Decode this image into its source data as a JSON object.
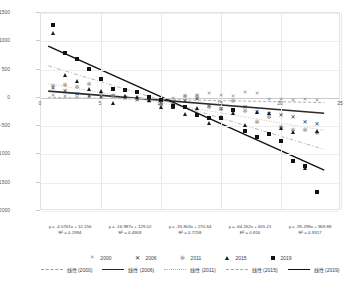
{
  "chart_data": {
    "type": "scatter",
    "title": "",
    "xlabel": "",
    "ylabel": "",
    "xlim": [
      0,
      25
    ],
    "ylim": [
      -2000,
      1500
    ],
    "grid": true,
    "legend_position": "bottom",
    "x_ticks": [
      "0",
      "5",
      "10",
      "15",
      "20",
      "25"
    ],
    "y_ticks": [
      "1500",
      "1000",
      "500",
      "0",
      "-500",
      "-1000",
      "-1500",
      "-2000"
    ],
    "series": [
      {
        "name": "2000",
        "marker": "x-thin",
        "trend_style": "dashed",
        "equation": "y = -4.0761x + 12.156",
        "r2": "R² = 0.1994",
        "slope": -4.0761,
        "intercept": 12.156,
        "points": [
          [
            1,
            30
          ],
          [
            2,
            10
          ],
          [
            3,
            5
          ],
          [
            4,
            -5
          ],
          [
            5,
            -10
          ],
          [
            6,
            8
          ],
          [
            7,
            -15
          ],
          [
            8,
            -8
          ],
          [
            9,
            -20
          ],
          [
            10,
            -30
          ],
          [
            11,
            -25
          ],
          [
            12,
            10
          ],
          [
            13,
            40
          ],
          [
            14,
            60
          ],
          [
            15,
            30
          ],
          [
            16,
            20
          ],
          [
            17,
            90
          ],
          [
            18,
            70
          ],
          [
            19,
            -40
          ],
          [
            20,
            -35
          ],
          [
            21,
            -50
          ],
          [
            22,
            -45
          ],
          [
            23,
            -60
          ]
        ]
      },
      {
        "name": "2006",
        "marker": "x-bold",
        "trend_style": "solid-dark",
        "equation": "y = -16.987x + 129.02",
        "r2": "R² = 0.4903",
        "slope": -16.987,
        "intercept": 129.02,
        "points": [
          [
            1,
            170
          ],
          [
            2,
            120
          ],
          [
            3,
            60
          ],
          [
            4,
            40
          ],
          [
            5,
            20
          ],
          [
            6,
            30
          ],
          [
            7,
            -10
          ],
          [
            8,
            -30
          ],
          [
            9,
            -60
          ],
          [
            10,
            -90
          ],
          [
            11,
            -100
          ],
          [
            12,
            -60
          ],
          [
            13,
            -20
          ],
          [
            14,
            -150
          ],
          [
            15,
            -200
          ],
          [
            16,
            -230
          ],
          [
            17,
            -160
          ],
          [
            18,
            -250
          ],
          [
            19,
            -280
          ],
          [
            20,
            -300
          ],
          [
            21,
            -330
          ],
          [
            22,
            -430
          ],
          [
            23,
            -470
          ]
        ]
      },
      {
        "name": "2011",
        "marker": "asterisk",
        "trend_style": "dotted",
        "equation": "y = -35.803x + 270.64",
        "r2": "R² = 0.7259",
        "slope": -35.803,
        "intercept": 270.64,
        "points": [
          [
            1,
            210
          ],
          [
            2,
            230
          ],
          [
            3,
            200
          ],
          [
            4,
            240
          ],
          [
            5,
            60
          ],
          [
            6,
            30
          ],
          [
            7,
            10
          ],
          [
            8,
            -20
          ],
          [
            9,
            -60
          ],
          [
            10,
            -120
          ],
          [
            11,
            -130
          ],
          [
            12,
            30
          ],
          [
            13,
            40
          ],
          [
            14,
            -160
          ],
          [
            15,
            -190
          ],
          [
            16,
            -60
          ],
          [
            17,
            -230
          ],
          [
            18,
            -430
          ],
          [
            19,
            -330
          ],
          [
            20,
            -520
          ],
          [
            21,
            -560
          ],
          [
            22,
            -570
          ],
          [
            23,
            -620
          ]
        ]
      },
      {
        "name": "2015",
        "marker": "triangle",
        "trend_style": "dashdot",
        "equation": "y = -64.262x + 605.21",
        "r2": "R² = 0.816",
        "slope": -64.262,
        "intercept": 605.21,
        "points": [
          [
            1,
            1140
          ],
          [
            2,
            400
          ],
          [
            3,
            300
          ],
          [
            4,
            160
          ],
          [
            5,
            120
          ],
          [
            6,
            -90
          ],
          [
            7,
            40
          ],
          [
            8,
            20
          ],
          [
            9,
            -30
          ],
          [
            10,
            -160
          ],
          [
            11,
            -170
          ],
          [
            12,
            -290
          ],
          [
            13,
            -180
          ],
          [
            14,
            -440
          ],
          [
            15,
            -330
          ],
          [
            16,
            -270
          ],
          [
            17,
            -480
          ],
          [
            18,
            -250
          ],
          [
            19,
            -260
          ],
          [
            20,
            -530
          ],
          [
            21,
            -600
          ],
          [
            22,
            -1240
          ],
          [
            23,
            -580
          ]
        ]
      },
      {
        "name": "2019",
        "marker": "square",
        "trend_style": "solid-black",
        "equation": "y = -95.298x + 969.88",
        "r2": "R² = 0.9317",
        "slope": -95.298,
        "intercept": 969.88,
        "points": [
          [
            1,
            1280
          ],
          [
            2,
            800
          ],
          [
            3,
            680
          ],
          [
            4,
            510
          ],
          [
            5,
            340
          ],
          [
            6,
            150
          ],
          [
            7,
            140
          ],
          [
            8,
            100
          ],
          [
            9,
            20
          ],
          [
            10,
            -40
          ],
          [
            11,
            -140
          ],
          [
            12,
            -160
          ],
          [
            13,
            -300
          ],
          [
            14,
            -360
          ],
          [
            15,
            -350
          ],
          [
            16,
            -220
          ],
          [
            17,
            -580
          ],
          [
            18,
            -690
          ],
          [
            19,
            -640
          ],
          [
            20,
            -760
          ],
          [
            21,
            -1110
          ],
          [
            22,
            -1210
          ],
          [
            23,
            -1670
          ]
        ]
      }
    ]
  },
  "legend": {
    "markers": [
      {
        "label": "2000",
        "symbol": "x-thin"
      },
      {
        "label": "2006",
        "symbol": "x-bold"
      },
      {
        "label": "2011",
        "symbol": "asterisk"
      },
      {
        "label": "2015",
        "symbol": "triangle"
      },
      {
        "label": "2019",
        "symbol": "square"
      }
    ],
    "lines": [
      {
        "label": "线性 (2000)",
        "style": "dashed"
      },
      {
        "label": "线性 (2006)",
        "style": "solid-dark"
      },
      {
        "label": "线性 (2011)",
        "style": "dotted"
      },
      {
        "label": "线性 (2015)",
        "style": "dashdot"
      },
      {
        "label": "线性 (2019)",
        "style": "solid-black"
      }
    ]
  },
  "colors": {
    "grid": "#e8e8e8",
    "axis": "#c9c9c9",
    "marker_dark": "#111111",
    "marker_light": "#8c8c8c",
    "text": "#404040"
  }
}
